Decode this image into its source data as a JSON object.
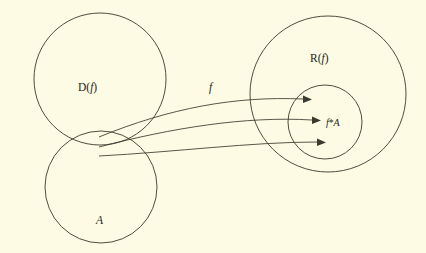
{
  "figure": {
    "kind": "set-mapping-diagram",
    "background_color": "#fdfbe3",
    "ink_color": "#3a3a2e",
    "width": 426,
    "height": 253
  },
  "labels": {
    "domain_roman": "D",
    "domain_paren_open": "(",
    "domain_func": "f",
    "domain_paren_close": ")",
    "range_roman": "R",
    "range_paren_open": "(",
    "range_func": "f",
    "range_paren_close": ")",
    "subset": "A",
    "image_func": "f",
    "image_star": "*",
    "image_set": "A",
    "map_label": "f"
  },
  "shapes": {
    "domain_circle": {
      "cx": 100,
      "cy": 79,
      "r": 66
    },
    "subset_circle": {
      "cx": 101,
      "cy": 187,
      "r": 56
    },
    "range_circle": {
      "cx": 328,
      "cy": 94,
      "r": 78
    },
    "image_circle": {
      "cx": 325,
      "cy": 122,
      "r": 37
    }
  },
  "arrows": [
    {
      "name": "arrow-top",
      "from_x": 99,
      "from_y": 137,
      "to_x": 307,
      "to_y": 100
    },
    {
      "name": "arrow-middle",
      "from_x": 99,
      "from_y": 147,
      "to_x": 316,
      "to_y": 121
    },
    {
      "name": "arrow-bottom",
      "from_x": 99,
      "from_y": 156,
      "to_x": 321,
      "to_y": 143
    }
  ]
}
